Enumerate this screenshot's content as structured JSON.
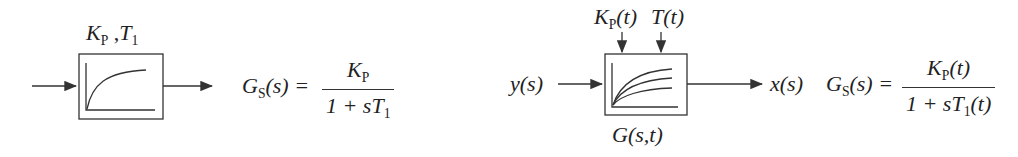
{
  "left_block": {
    "params_label": {
      "K": "K",
      "K_sub": "P",
      "sep": " ,",
      "T": "T",
      "T_sub": "1"
    },
    "formula": {
      "lhs": "G",
      "lhs_sub": "S",
      "lhs_arg": "(s) =",
      "num": "K",
      "num_sub": "P",
      "den_prefix": "1 + s",
      "den_T": "T",
      "den_sub": "1"
    },
    "step_response_curves": 1
  },
  "right_block": {
    "param_inputs": [
      {
        "name": "K",
        "sub": "P",
        "arg": "(t)"
      },
      {
        "name": "T",
        "sub": "",
        "arg": "(t)"
      }
    ],
    "input_label": "y(s)",
    "output_label": "x(s)",
    "block_label": "G(s,t)",
    "formula": {
      "lhs": "G",
      "lhs_sub": "S",
      "lhs_arg": "(s) =",
      "num": "K",
      "num_sub": "P",
      "num_arg": "(t)",
      "den_prefix": "1 + s",
      "den_T": "T",
      "den_sub": "1",
      "den_arg": "(t)"
    },
    "step_response_curves": 3
  },
  "colors": {
    "line": "#333333",
    "background": "#ffffff"
  }
}
